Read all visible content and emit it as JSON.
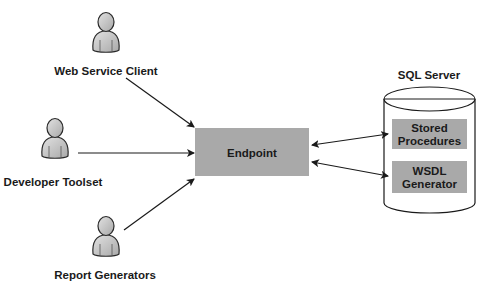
{
  "actors": [
    {
      "id": "web-service-client",
      "label": "Web Service Client"
    },
    {
      "id": "developer-toolset",
      "label": "Developer Toolset"
    },
    {
      "id": "report-generators",
      "label": "Report Generators"
    }
  ],
  "endpoint": {
    "label": "Endpoint"
  },
  "server": {
    "title": "SQL Server",
    "components": [
      {
        "line1": "Stored",
        "line2": "Procedures"
      },
      {
        "line1": "WSDL",
        "line2": "Generator"
      }
    ]
  },
  "colors": {
    "box_fill": "#a9a9a9",
    "line": "#1a1a1a",
    "person_fill": "#c8c8c8",
    "background": "#ffffff"
  },
  "connections": [
    {
      "from": "Web Service Client",
      "to": "Endpoint",
      "direction": "one-way"
    },
    {
      "from": "Developer Toolset",
      "to": "Endpoint",
      "direction": "one-way"
    },
    {
      "from": "Report Generators",
      "to": "Endpoint",
      "direction": "one-way"
    },
    {
      "from": "Endpoint",
      "to": "Stored Procedures",
      "direction": "two-way"
    },
    {
      "from": "Endpoint",
      "to": "WSDL Generator",
      "direction": "two-way"
    }
  ]
}
